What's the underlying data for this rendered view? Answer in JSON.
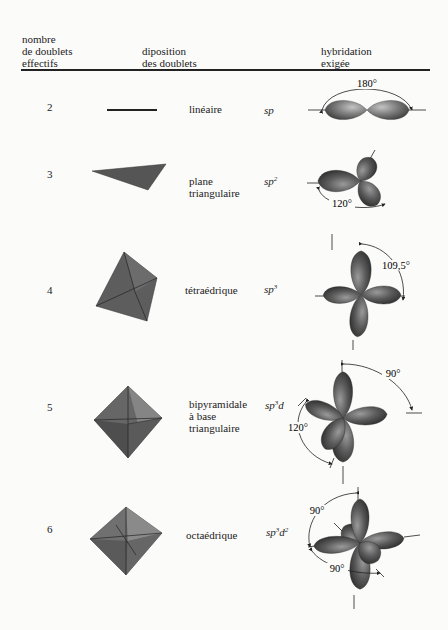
{
  "header": {
    "col1": [
      "nombre",
      "de doublets",
      "effectifs"
    ],
    "col2": [
      "diposition",
      "des doublets"
    ],
    "col3": [
      "hybridation",
      "exigée"
    ]
  },
  "rows": [
    {
      "n": "2",
      "geometry": [
        "linéaire"
      ],
      "hyb_base": "sp",
      "hyb_sup1": "",
      "hyb_mid": "",
      "hyb_sup2": "",
      "angles": [
        "180°"
      ]
    },
    {
      "n": "3",
      "geometry": [
        "plane",
        "triangulaire"
      ],
      "hyb_base": "sp",
      "hyb_sup1": "2",
      "hyb_mid": "",
      "hyb_sup2": "",
      "angles": [
        "120°"
      ]
    },
    {
      "n": "4",
      "geometry": [
        "tétraédrique"
      ],
      "hyb_base": "sp",
      "hyb_sup1": "3",
      "hyb_mid": "",
      "hyb_sup2": "",
      "angles": [
        "109,5°"
      ]
    },
    {
      "n": "5",
      "geometry": [
        "bipyramidale",
        "à base",
        "triangulaire"
      ],
      "hyb_base": "sp",
      "hyb_sup1": "3",
      "hyb_mid": "d",
      "hyb_sup2": "",
      "angles": [
        "90°",
        "120°"
      ]
    },
    {
      "n": "6",
      "geometry": [
        "octaédrique"
      ],
      "hyb_base": "sp",
      "hyb_sup1": "3",
      "hyb_mid": "d",
      "hyb_sup2": "2",
      "angles": [
        "90°",
        "90°"
      ]
    }
  ],
  "colors": {
    "lobe": "#6e6e6e",
    "lobe_light": "#a8a8a8",
    "polyhedron": "#5f5f5f",
    "rule": "#222222"
  }
}
